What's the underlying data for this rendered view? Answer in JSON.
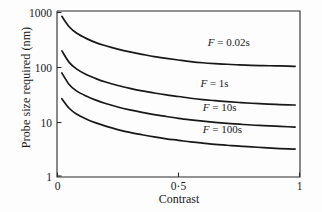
{
  "chart_data": {
    "type": "line",
    "title": "",
    "xlabel": "Contrast",
    "ylabel": "Probe size required (nm)",
    "xlim": [
      0,
      1
    ],
    "ylim": [
      1,
      1000
    ],
    "yscale": "log",
    "xscale": "linear",
    "grid": false,
    "legend_position": "inline-right",
    "xticks": [
      "0",
      "0·5",
      "1"
    ],
    "xtick_values": [
      0,
      0.5,
      1
    ],
    "yticks": [
      "1",
      "10",
      "100",
      "1000"
    ],
    "ytick_values": [
      1,
      10,
      100,
      1000
    ],
    "series": [
      {
        "name": "F = 0.02s",
        "label_italic": "F",
        "label_rest": " = 0.02s",
        "x": [
          0.02,
          0.05,
          0.08,
          0.12,
          0.16,
          0.2,
          0.25,
          0.3,
          0.35,
          0.4,
          0.45,
          0.5,
          0.55,
          0.6,
          0.65,
          0.7,
          0.75,
          0.8,
          0.85,
          0.9,
          0.95,
          0.98
        ],
        "values": [
          800,
          520,
          400,
          320,
          268,
          236,
          205,
          182,
          165,
          150,
          139,
          130,
          122,
          116,
          112,
          109,
          106,
          104,
          103,
          102,
          101,
          100
        ]
      },
      {
        "name": "F = 1s",
        "label_italic": "F",
        "label_rest": " = 1s",
        "x": [
          0.02,
          0.05,
          0.08,
          0.12,
          0.16,
          0.2,
          0.25,
          0.3,
          0.35,
          0.4,
          0.45,
          0.5,
          0.55,
          0.6,
          0.65,
          0.7,
          0.75,
          0.8,
          0.85,
          0.9,
          0.95,
          0.98
        ],
        "values": [
          190,
          118,
          90,
          71,
          60,
          52,
          45,
          40,
          36,
          33,
          30.5,
          28.5,
          26.5,
          25,
          24,
          23,
          22.2,
          21.5,
          21,
          20.5,
          20.1,
          20
        ]
      },
      {
        "name": "F = 10s",
        "label_italic": "F",
        "label_rest": " = 10s",
        "x": [
          0.02,
          0.05,
          0.08,
          0.12,
          0.16,
          0.2,
          0.25,
          0.3,
          0.35,
          0.4,
          0.45,
          0.5,
          0.55,
          0.6,
          0.65,
          0.7,
          0.75,
          0.8,
          0.85,
          0.9,
          0.95,
          0.98
        ],
        "values": [
          76,
          47,
          36,
          29,
          24.5,
          21.3,
          18.4,
          16.3,
          14.7,
          13.4,
          12.4,
          11.5,
          10.8,
          10.2,
          9.7,
          9.3,
          9.0,
          8.7,
          8.5,
          8.3,
          8.1,
          8.0
        ]
      },
      {
        "name": "F = 100s",
        "label_italic": "F",
        "label_rest": " = 100s",
        "x": [
          0.02,
          0.05,
          0.08,
          0.12,
          0.16,
          0.2,
          0.25,
          0.3,
          0.35,
          0.4,
          0.45,
          0.5,
          0.55,
          0.6,
          0.65,
          0.7,
          0.75,
          0.8,
          0.85,
          0.9,
          0.95,
          0.98
        ],
        "values": [
          26,
          17.5,
          13.8,
          11.2,
          9.5,
          8.3,
          7.2,
          6.4,
          5.8,
          5.3,
          4.9,
          4.6,
          4.3,
          4.1,
          3.9,
          3.75,
          3.6,
          3.5,
          3.4,
          3.3,
          3.22,
          3.2
        ]
      }
    ],
    "series_label_positions": [
      {
        "x": 0.62,
        "y_value": 230
      },
      {
        "x": 0.59,
        "y_value": 43
      },
      {
        "x": 0.6,
        "y_value": 15.5
      },
      {
        "x": 0.6,
        "y_value": 6.2
      }
    ],
    "colors": {
      "curve": "#181818",
      "axis": "#2b2b2b",
      "text": "#1a1a1a",
      "background": "#fdfdfd"
    }
  }
}
